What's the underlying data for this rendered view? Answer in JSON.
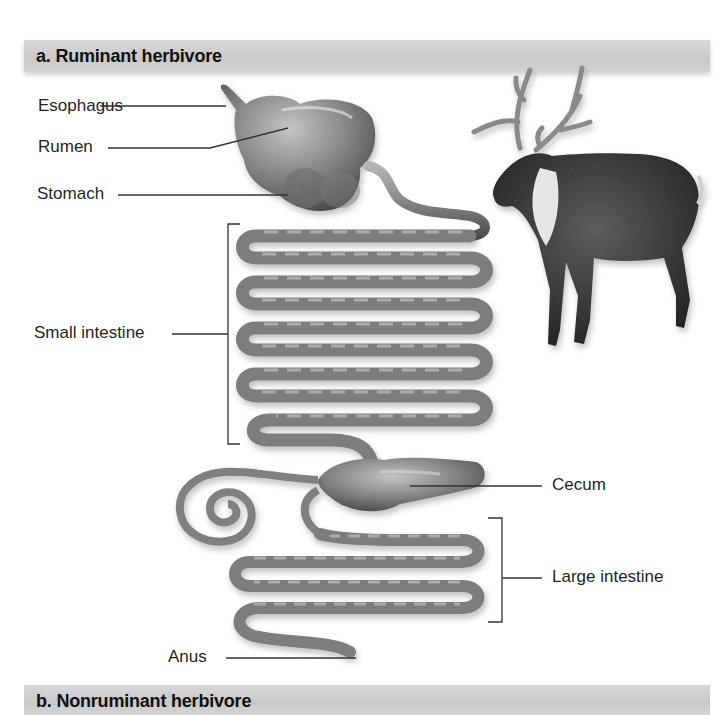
{
  "panel_a": {
    "title": "a. Ruminant herbivore",
    "animal": "reindeer-illustration",
    "labels": {
      "esophagus": "Esophagus",
      "rumen": "Rumen",
      "stomach": "Stomach",
      "small_intestine": "Small intestine",
      "cecum": "Cecum",
      "large_intestine": "Large intestine",
      "anus": "Anus"
    }
  },
  "panel_b": {
    "title": "b. Nonruminant herbivore"
  },
  "colors": {
    "banner": "#cfcfcf",
    "organ_mid": "#8a8a8a",
    "organ_dark": "#4a4a4a",
    "leader_line": "#333333",
    "text": "#1f1f1f"
  }
}
